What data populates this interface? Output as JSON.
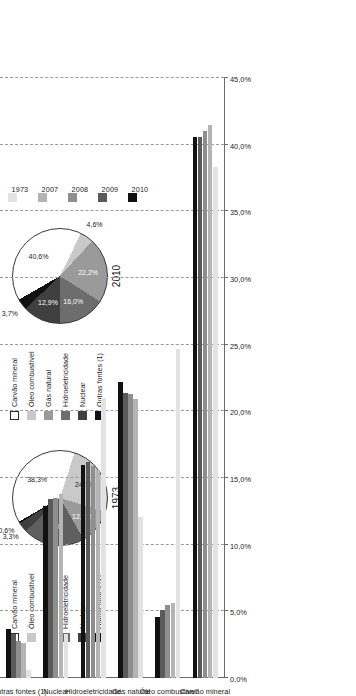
{
  "year_legend": {
    "items": [
      {
        "label": "1973",
        "color": "#e2e2e2"
      },
      {
        "label": "2007",
        "color": "#b4b4b4"
      },
      {
        "label": "2008",
        "color": "#8e8e8e"
      },
      {
        "label": "2009",
        "color": "#5a5a5a"
      },
      {
        "label": "2010",
        "color": "#111111"
      }
    ]
  },
  "source_legend": {
    "items": [
      {
        "label": "Carvão mineral",
        "color": "#ffffff"
      },
      {
        "label": "Óleo combustível",
        "color": "#c9c9c9"
      },
      {
        "label": "Gás natural",
        "color": "#9a9a9a"
      },
      {
        "label": "Hidroeletricidade",
        "color": "#6d6d6d"
      },
      {
        "label": "Nuclear",
        "color": "#3f3f3f"
      },
      {
        "label": "Outras fontes (1)",
        "color": "#111111"
      }
    ]
  },
  "pies": [
    {
      "title": "1973",
      "slices": [
        {
          "label": "Carvão mineral",
          "value": 38.3,
          "text": "38,3%",
          "color": "#ffffff",
          "text_color": "#1a1a1a"
        },
        {
          "label": "Óleo combustível",
          "value": 24.7,
          "text": "24,7%",
          "color": "#c9c9c9",
          "text_color": "#1a1a1a"
        },
        {
          "label": "Gás natural",
          "value": 12.1,
          "text": "12,1%",
          "color": "#9a9a9a",
          "text_color": "#ffffff"
        },
        {
          "label": "Hidroeletricidade",
          "value": 21.0,
          "text": "21%",
          "color": "#5f5f5f",
          "text_color": "#ffffff"
        },
        {
          "label": "Nuclear",
          "value": 3.3,
          "text": "3,3%",
          "color": "#3f3f3f",
          "text_color": "#1a1a1a"
        },
        {
          "label": "Outras fontes (1)",
          "value": 0.6,
          "text": "0,6%",
          "color": "#111111",
          "text_color": "#1a1a1a"
        }
      ]
    },
    {
      "title": "2010",
      "slices": [
        {
          "label": "Carvão mineral",
          "value": 40.6,
          "text": "40,6%",
          "color": "#ffffff",
          "text_color": "#1a1a1a"
        },
        {
          "label": "Óleo combustível",
          "value": 4.6,
          "text": "4,6%",
          "color": "#c9c9c9",
          "text_color": "#1a1a1a"
        },
        {
          "label": "Gás natural",
          "value": 22.2,
          "text": "22,2%",
          "color": "#9a9a9a",
          "text_color": "#ffffff"
        },
        {
          "label": "Hidroeletricidade",
          "value": 16.0,
          "text": "16,0%",
          "color": "#6d6d6d",
          "text_color": "#ffffff"
        },
        {
          "label": "Nuclear",
          "value": 12.9,
          "text": "12,9%",
          "color": "#3f3f3f",
          "text_color": "#ffffff"
        },
        {
          "label": "Outras fontes (1)",
          "value": 3.7,
          "text": "3,7%",
          "color": "#111111",
          "text_color": "#1a1a1a"
        }
      ]
    }
  ],
  "chart_data": {
    "type": "bar",
    "title": "",
    "xlabel": "",
    "ylabel": "",
    "orientation": "vertical",
    "grid": true,
    "legend_position": "top-right",
    "ylim": [
      0,
      45
    ],
    "ytick_labels": [
      "45,0%",
      "40,0%",
      "35,0%",
      "30,0%",
      "25,0%",
      "20,0%",
      "15,0%",
      "10,0%",
      "5,0%",
      "0,0%"
    ],
    "ytick_values": [
      45,
      40,
      35,
      30,
      25,
      20,
      15,
      10,
      5,
      0
    ],
    "categories": [
      "Carvão mineral",
      "Óleo combustível",
      "Gás natural",
      "Hidroeletricidade",
      "Nuclear",
      "Outras fontes (1)"
    ],
    "series": [
      {
        "name": "1973",
        "color": "#e2e2e2",
        "values": [
          38.3,
          24.7,
          12.1,
          21.0,
          3.3,
          0.6
        ]
      },
      {
        "name": "2007",
        "color": "#b4b4b4",
        "values": [
          41.5,
          5.6,
          20.9,
          15.6,
          13.8,
          2.6
        ]
      },
      {
        "name": "2008",
        "color": "#8e8e8e",
        "values": [
          41.0,
          5.5,
          21.3,
          15.9,
          13.5,
          2.8
        ]
      },
      {
        "name": "2009",
        "color": "#5a5a5a",
        "values": [
          40.6,
          5.1,
          21.4,
          16.2,
          13.4,
          3.3
        ]
      },
      {
        "name": "2010",
        "color": "#111111",
        "values": [
          40.6,
          4.6,
          22.2,
          16.0,
          12.9,
          3.7
        ]
      }
    ]
  }
}
